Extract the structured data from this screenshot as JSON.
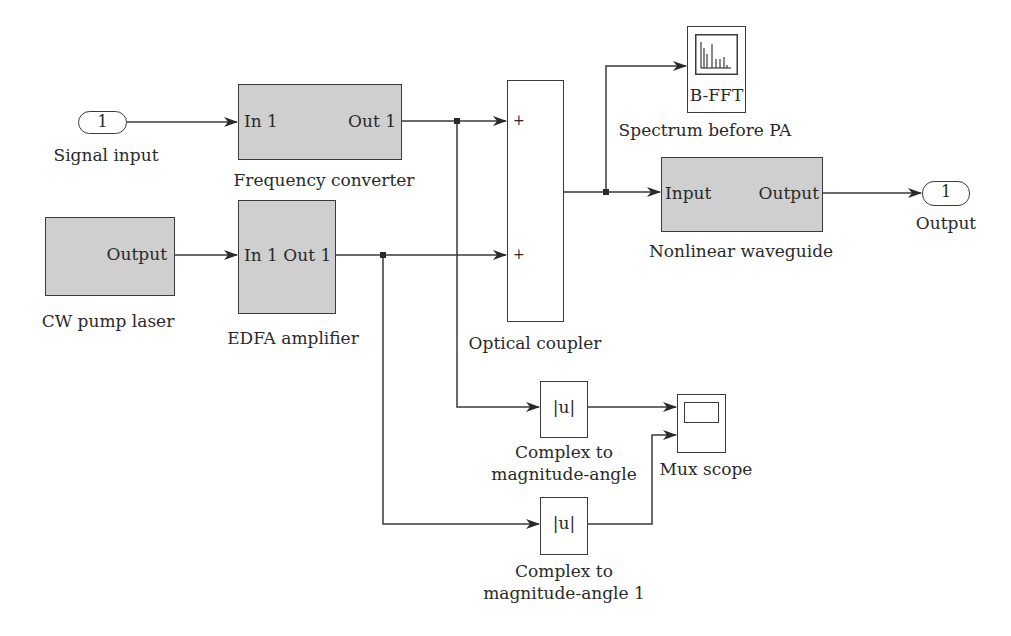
{
  "diagram": {
    "type": "simulink-block-diagram",
    "blocks": {
      "signal_input": {
        "value": "1",
        "label": "Signal input"
      },
      "frequency_converter": {
        "in_port": "In 1",
        "out_port": "Out 1",
        "label": "Frequency converter"
      },
      "cw_pump_laser": {
        "out_port": "Output",
        "label": "CW pump laser"
      },
      "edfa_amplifier": {
        "ports": "In 1 Out 1",
        "label": "EDFA amplifier"
      },
      "optical_coupler": {
        "in1_sign": "+",
        "in2_sign": "+",
        "label": "Optical coupler"
      },
      "spectrum_before_pa": {
        "text": "B-FFT",
        "label": "Spectrum before PA"
      },
      "nonlinear_waveguide": {
        "in_port": "Input",
        "out_port": "Output",
        "label": "Nonlinear waveguide"
      },
      "output": {
        "value": "1",
        "label": "Output"
      },
      "complex_mag_angle": {
        "symbol": "|u|",
        "label_line1": "Complex to",
        "label_line2": "magnitude-angle"
      },
      "complex_mag_angle_1": {
        "symbol": "|u|",
        "label_line1": "Complex to",
        "label_line2": "magnitude-angle 1"
      },
      "mux_scope": {
        "label": "Mux scope"
      }
    },
    "connections": [
      {
        "from": "Signal input",
        "to": "Frequency converter"
      },
      {
        "from": "Frequency converter",
        "to": "Optical coupler (+1)"
      },
      {
        "from": "Frequency converter",
        "to": "Complex to magnitude-angle"
      },
      {
        "from": "CW pump laser",
        "to": "EDFA amplifier"
      },
      {
        "from": "EDFA amplifier",
        "to": "Optical coupler (+2)"
      },
      {
        "from": "EDFA amplifier",
        "to": "Complex to magnitude-angle 1"
      },
      {
        "from": "Optical coupler",
        "to": "Spectrum before PA"
      },
      {
        "from": "Optical coupler",
        "to": "Nonlinear waveguide"
      },
      {
        "from": "Nonlinear waveguide",
        "to": "Output"
      },
      {
        "from": "Complex to magnitude-angle",
        "to": "Mux scope (in1)"
      },
      {
        "from": "Complex to magnitude-angle 1",
        "to": "Mux scope (in2)"
      }
    ]
  }
}
